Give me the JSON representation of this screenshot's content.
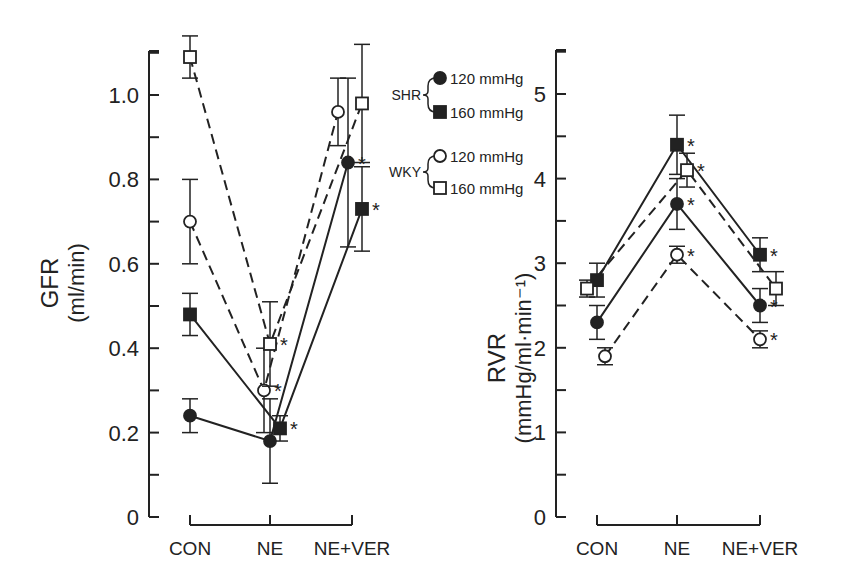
{
  "chart_data": [
    {
      "type": "line",
      "title": "",
      "xlabel": "",
      "ylabel": "GFR",
      "ylabel_unit": "(ml/min)",
      "categories": [
        "CON",
        "NE",
        "NE+VER"
      ],
      "ylim": [
        0,
        1.1
      ],
      "yticks": [
        0,
        0.2,
        0.4,
        0.6,
        0.8,
        1.0
      ],
      "ytick_labels": [
        "0",
        "0.2",
        "0.4",
        "0.6",
        "0.8",
        "1.0"
      ],
      "grid": false,
      "series": [
        {
          "name": "SHR 120 mmHg",
          "marker": "filled-circle",
          "line": "solid",
          "values": [
            0.24,
            0.18,
            0.84
          ],
          "err": [
            0.04,
            0.1,
            0.2
          ],
          "x_offset": [
            0,
            0,
            -4
          ],
          "significant": [
            false,
            false,
            true
          ]
        },
        {
          "name": "SHR 160 mmHg",
          "marker": "filled-square",
          "line": "solid",
          "values": [
            0.48,
            0.21,
            0.73
          ],
          "err": [
            0.05,
            0.03,
            0.1
          ],
          "x_offset": [
            0,
            10,
            10
          ],
          "significant": [
            false,
            true,
            true
          ]
        },
        {
          "name": "WKY 120 mmHg",
          "marker": "open-circle",
          "line": "dashed",
          "values": [
            0.7,
            0.3,
            0.96
          ],
          "err": [
            0.1,
            0.1,
            0.08
          ],
          "x_offset": [
            0,
            -6,
            -14
          ],
          "significant": [
            false,
            true,
            false
          ]
        },
        {
          "name": "WKY 160 mmHg",
          "marker": "open-square",
          "line": "dashed",
          "values": [
            1.09,
            0.41,
            0.98
          ],
          "err": [
            0.05,
            0.1,
            0.14
          ],
          "x_offset": [
            0,
            0,
            10
          ],
          "significant": [
            false,
            true,
            false
          ]
        }
      ]
    },
    {
      "type": "line",
      "title": "",
      "xlabel": "",
      "ylabel": "RVR",
      "ylabel_unit": "(mmHg/ml·min⁻¹)",
      "categories": [
        "CON",
        "NE",
        "NE+VER"
      ],
      "ylim": [
        0,
        5.5
      ],
      "yticks": [
        0,
        1,
        2,
        3,
        4,
        5
      ],
      "ytick_labels": [
        "0",
        "1",
        "2",
        "3",
        "4",
        "5"
      ],
      "grid": false,
      "series": [
        {
          "name": "SHR 120 mmHg",
          "marker": "filled-circle",
          "line": "solid",
          "values": [
            2.3,
            3.7,
            2.5
          ],
          "err": [
            0.2,
            0.3,
            0.2
          ],
          "x_offset": [
            0,
            0,
            0
          ],
          "significant": [
            false,
            true,
            true
          ]
        },
        {
          "name": "SHR 160 mmHg",
          "marker": "filled-square",
          "line": "solid",
          "values": [
            2.8,
            4.4,
            3.1
          ],
          "err": [
            0.2,
            0.35,
            0.2
          ],
          "x_offset": [
            0,
            0,
            0
          ],
          "significant": [
            false,
            true,
            true
          ]
        },
        {
          "name": "WKY 120 mmHg",
          "marker": "open-circle",
          "line": "dashed",
          "values": [
            1.9,
            3.1,
            2.1
          ],
          "err": [
            0.1,
            0.1,
            0.1
          ],
          "x_offset": [
            8,
            0,
            0
          ],
          "significant": [
            false,
            true,
            true
          ]
        },
        {
          "name": "WKY 160 mmHg",
          "marker": "open-square",
          "line": "dashed",
          "values": [
            2.7,
            4.1,
            2.7
          ],
          "err": [
            0.1,
            0.2,
            0.2
          ],
          "x_offset": [
            -10,
            10,
            16
          ],
          "significant": [
            false,
            true,
            false
          ]
        }
      ]
    }
  ],
  "legend": {
    "groups": [
      {
        "label": "SHR",
        "items": [
          {
            "marker": "filled-circle",
            "label": "120 mmHg"
          },
          {
            "marker": "filled-square",
            "label": "160 mmHg"
          }
        ]
      },
      {
        "label": "WKY",
        "items": [
          {
            "marker": "open-circle",
            "label": "120 mmHg"
          },
          {
            "marker": "open-square",
            "label": "160 mmHg"
          }
        ]
      }
    ]
  },
  "significance_marker": "*",
  "colors": {
    "ink": "#222222",
    "background": "#ffffff"
  }
}
